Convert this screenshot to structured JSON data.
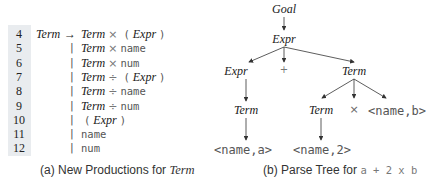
{
  "productions": {
    "rows": [
      {
        "num": "4",
        "lhs": "Term",
        "arrow": "→",
        "rhs": [
          {
            "t": "nt",
            "v": "Term"
          },
          {
            "t": "op",
            "v": "×"
          },
          {
            "t": "tm",
            "v": "("
          },
          {
            "t": "nt",
            "v": "Expr"
          },
          {
            "t": "tm",
            "v": ")"
          }
        ]
      },
      {
        "num": "5",
        "bar": "|",
        "rhs": [
          {
            "t": "nt",
            "v": "Term"
          },
          {
            "t": "op",
            "v": "×"
          },
          {
            "t": "tm",
            "v": "name"
          }
        ]
      },
      {
        "num": "6",
        "bar": "|",
        "rhs": [
          {
            "t": "nt",
            "v": "Term"
          },
          {
            "t": "op",
            "v": "×"
          },
          {
            "t": "tm",
            "v": "num"
          }
        ]
      },
      {
        "num": "7",
        "bar": "|",
        "rhs": [
          {
            "t": "nt",
            "v": "Term"
          },
          {
            "t": "op",
            "v": "÷"
          },
          {
            "t": "tm",
            "v": "("
          },
          {
            "t": "nt",
            "v": "Expr"
          },
          {
            "t": "tm",
            "v": ")"
          }
        ]
      },
      {
        "num": "8",
        "bar": "|",
        "rhs": [
          {
            "t": "nt",
            "v": "Term"
          },
          {
            "t": "op",
            "v": "÷"
          },
          {
            "t": "tm",
            "v": "name"
          }
        ]
      },
      {
        "num": "9",
        "bar": "|",
        "rhs": [
          {
            "t": "nt",
            "v": "Term"
          },
          {
            "t": "op",
            "v": "÷"
          },
          {
            "t": "tm",
            "v": "num"
          }
        ]
      },
      {
        "num": "10",
        "bar": "|",
        "rhs": [
          {
            "t": "tm",
            "v": "("
          },
          {
            "t": "nt",
            "v": "Expr"
          },
          {
            "t": "tm",
            "v": ")"
          }
        ]
      },
      {
        "num": "11",
        "bar": "|",
        "rhs": [
          {
            "t": "tm",
            "v": "name"
          }
        ]
      },
      {
        "num": "12",
        "bar": "|",
        "rhs": [
          {
            "t": "tm",
            "v": "num"
          }
        ]
      }
    ],
    "caption_prefix": "(a) New Productions for ",
    "caption_term": "Term"
  },
  "tree": {
    "nodes": {
      "goal": "Goal",
      "expr_root": "Expr",
      "expr_left": "Expr",
      "plus": "+",
      "term_right": "Term",
      "term_left": "Term",
      "name_a": "<name,a>",
      "term_inner": "Term",
      "times": "×",
      "name_b": "<name,b>",
      "name_2": "<name,2>"
    },
    "caption_prefix": "(b) Parse Tree for ",
    "caption_expr": "a + 2 x b"
  }
}
